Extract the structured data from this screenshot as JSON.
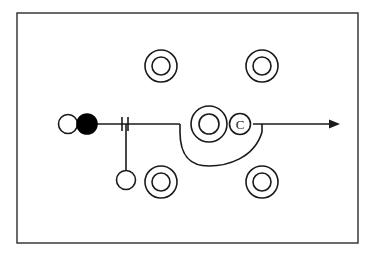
{
  "figure": {
    "kind": "schematic-line-diagram",
    "title": "",
    "caption": "",
    "background_color": "#ffffff",
    "stroke_color": "#1a1a1a",
    "fill_black": "#000000",
    "fill_white": "#ffffff",
    "frame": {
      "label": "diagram-frame",
      "x": 17,
      "y": 13,
      "width": 341,
      "height": 230,
      "stroke_width": 1.4,
      "stroke_color": "#2b2b2b"
    }
  },
  "nodes": {
    "open_circle_left": {
      "label": "",
      "cx": 68,
      "cy": 124,
      "r": 9.5,
      "fill": "#ffffff",
      "stroke": "#1a1a1a"
    },
    "filled_circle": {
      "label": "",
      "cx": 87,
      "cy": 124,
      "r": 10,
      "fill": "#000000",
      "stroke": "#000000"
    },
    "open_circle_bottom": {
      "label": "",
      "cx": 126,
      "cy": 180,
      "r": 9.5,
      "fill": "#ffffff",
      "stroke": "#1a1a1a"
    }
  },
  "donuts": [
    {
      "name": "donut-top-left",
      "cx": 161,
      "cy": 66,
      "r_outer": 16,
      "r_inner": 9
    },
    {
      "name": "donut-top-right",
      "cx": 262,
      "cy": 66,
      "r_outer": 16,
      "r_inner": 9
    },
    {
      "name": "donut-center",
      "cx": 209,
      "cy": 124,
      "r_outer": 18,
      "r_inner": 10
    },
    {
      "name": "donut-bottom-left",
      "cx": 161,
      "cy": 182,
      "r_outer": 16,
      "r_inner": 9
    },
    {
      "name": "donut-bottom-right",
      "cx": 262,
      "cy": 182,
      "r_outer": 16,
      "r_inner": 9
    }
  ],
  "symbols": {
    "circled_c": {
      "name": "circled-c-symbol",
      "text": "C",
      "cx": 240,
      "cy": 124,
      "r": 10.5,
      "font_size": 13
    }
  },
  "connectors": {
    "main_line": {
      "name": "main-horizontal-line",
      "x1": 97,
      "y1": 124,
      "x2": 180,
      "y2": 124
    },
    "drop_line": {
      "name": "vertical-drop-line",
      "x1": 126,
      "y1": 124,
      "x2": 126,
      "y2": 170
    },
    "tick_marks": {
      "name": "double-tick-marks",
      "x_positions": [
        122,
        128
      ],
      "y_top": 117,
      "y_bottom": 131
    },
    "loop": {
      "name": "loop-curve",
      "path": "M 180 124 L 180 132 C 180 158 192 166 209 166 C 226 166 254 159 262 132 L 262 124"
    },
    "arrow": {
      "name": "arrow-right",
      "x1": 253,
      "y1": 124,
      "x2": 340,
      "y2": 124,
      "head_size": 7
    }
  },
  "a11y": {
    "figure_description": "Schematic line diagram inside a rectangular frame: an open circle and a filled circle on the left joined by a horizontal line bearing two tick marks, a vertical drop line ending in a small open circle, four concentric donut symbols at the corners, a central donut with a circled C inside a downward loop, and a rightward arrow."
  }
}
